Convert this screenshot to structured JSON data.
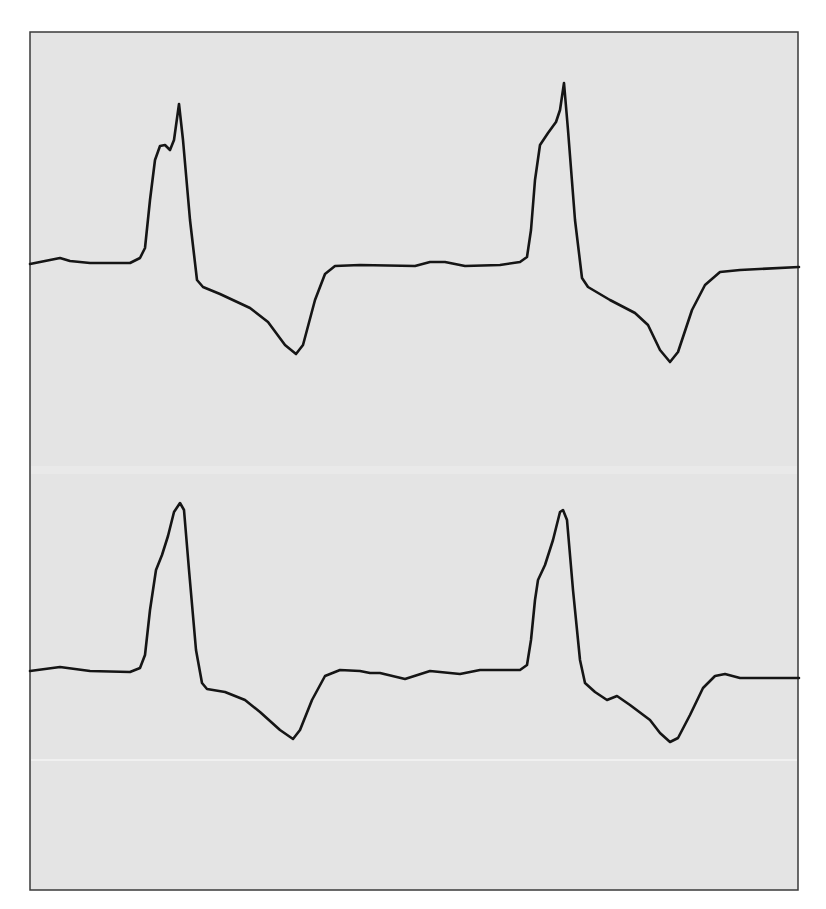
{
  "figure": {
    "background": "#e4e4e4",
    "frame_color": "#3a3a3a",
    "trace_color": "#151515",
    "frame": {
      "x": 30,
      "y": 32,
      "width": 768,
      "height": 858
    }
  },
  "chart_data": {
    "type": "line",
    "title": "",
    "xlabel": "",
    "ylabel": "",
    "grid": false,
    "legend": null,
    "coordinate_space": "pixel coordinates of 826x909 image (y increases downward)",
    "series": [
      {
        "name": "trace-1 (top)",
        "points": [
          [
            30,
            264
          ],
          [
            45,
            261
          ],
          [
            60,
            258
          ],
          [
            70,
            261
          ],
          [
            90,
            263
          ],
          [
            130,
            263
          ],
          [
            140,
            258
          ],
          [
            145,
            248
          ],
          [
            150,
            200
          ],
          [
            155,
            160
          ],
          [
            160,
            146
          ],
          [
            165,
            145
          ],
          [
            170,
            150
          ],
          [
            174,
            140
          ],
          [
            179,
            104
          ],
          [
            183,
            140
          ],
          [
            190,
            220
          ],
          [
            197,
            280
          ],
          [
            203,
            287
          ],
          [
            220,
            294
          ],
          [
            250,
            308
          ],
          [
            268,
            322
          ],
          [
            285,
            345
          ],
          [
            296,
            354
          ],
          [
            303,
            345
          ],
          [
            315,
            300
          ],
          [
            325,
            274
          ],
          [
            335,
            266
          ],
          [
            360,
            265
          ],
          [
            415,
            266
          ],
          [
            430,
            262
          ],
          [
            445,
            262
          ],
          [
            465,
            266
          ],
          [
            500,
            265
          ],
          [
            520,
            262
          ],
          [
            527,
            257
          ],
          [
            531,
            230
          ],
          [
            535,
            180
          ],
          [
            540,
            145
          ],
          [
            548,
            133
          ],
          [
            556,
            122
          ],
          [
            560,
            110
          ],
          [
            564,
            83
          ],
          [
            568,
            130
          ],
          [
            575,
            220
          ],
          [
            582,
            278
          ],
          [
            588,
            287
          ],
          [
            610,
            300
          ],
          [
            635,
            313
          ],
          [
            648,
            325
          ],
          [
            660,
            350
          ],
          [
            670,
            362
          ],
          [
            678,
            352
          ],
          [
            692,
            310
          ],
          [
            705,
            285
          ],
          [
            720,
            272
          ],
          [
            740,
            270
          ],
          [
            799,
            267
          ]
        ]
      },
      {
        "name": "trace-2 (bottom)",
        "points": [
          [
            30,
            671
          ],
          [
            60,
            667
          ],
          [
            90,
            671
          ],
          [
            130,
            672
          ],
          [
            140,
            668
          ],
          [
            145,
            655
          ],
          [
            150,
            610
          ],
          [
            156,
            570
          ],
          [
            162,
            555
          ],
          [
            168,
            536
          ],
          [
            174,
            512
          ],
          [
            180,
            503
          ],
          [
            184,
            510
          ],
          [
            189,
            570
          ],
          [
            196,
            650
          ],
          [
            202,
            683
          ],
          [
            207,
            689
          ],
          [
            225,
            692
          ],
          [
            245,
            700
          ],
          [
            260,
            712
          ],
          [
            280,
            730
          ],
          [
            293,
            739
          ],
          [
            300,
            730
          ],
          [
            312,
            700
          ],
          [
            325,
            676
          ],
          [
            340,
            670
          ],
          [
            360,
            671
          ],
          [
            370,
            673
          ],
          [
            380,
            673
          ],
          [
            405,
            679
          ],
          [
            430,
            671
          ],
          [
            460,
            674
          ],
          [
            480,
            670
          ],
          [
            520,
            670
          ],
          [
            527,
            665
          ],
          [
            531,
            640
          ],
          [
            535,
            600
          ],
          [
            538,
            580
          ],
          [
            545,
            565
          ],
          [
            553,
            540
          ],
          [
            560,
            512
          ],
          [
            563,
            510
          ],
          [
            567,
            520
          ],
          [
            573,
            590
          ],
          [
            580,
            660
          ],
          [
            585,
            683
          ],
          [
            595,
            692
          ],
          [
            607,
            700
          ],
          [
            617,
            696
          ],
          [
            630,
            705
          ],
          [
            650,
            720
          ],
          [
            660,
            733
          ],
          [
            670,
            742
          ],
          [
            678,
            738
          ],
          [
            690,
            715
          ],
          [
            703,
            688
          ],
          [
            715,
            676
          ],
          [
            725,
            674
          ],
          [
            740,
            678
          ],
          [
            799,
            678
          ]
        ]
      }
    ],
    "annotations": [],
    "decorations": {
      "light_horizontal_lines_y": [
        470,
        760
      ]
    }
  }
}
